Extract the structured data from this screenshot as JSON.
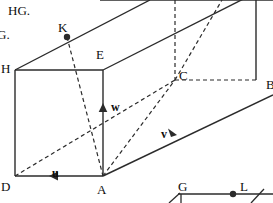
{
  "figure": {
    "title_fragments": [
      {
        "id": "note-hg",
        "text": "HG.",
        "x": 8,
        "y": 4
      },
      {
        "id": "note-g",
        "text": "G.",
        "x": -3,
        "y": 28
      }
    ],
    "stroke_color": "#2b2b2b",
    "label_color": "#0d0d0d",
    "background": "#ffffff",
    "vertex_labels": [
      {
        "name": "H",
        "text": "H",
        "x": 1,
        "y": 62
      },
      {
        "name": "K",
        "text": "K",
        "x": 58,
        "y": 21
      },
      {
        "name": "E",
        "text": "E",
        "x": 96,
        "y": 48
      },
      {
        "name": "C",
        "text": "C",
        "x": 179,
        "y": 69
      },
      {
        "name": "B",
        "text": "B",
        "x": 266,
        "y": 78
      },
      {
        "name": "D",
        "text": "D",
        "x": 1,
        "y": 180
      },
      {
        "name": "A",
        "text": "A",
        "x": 97,
        "y": 183
      }
    ],
    "vector_labels": [
      {
        "name": "u",
        "text": "u",
        "x": 52,
        "y": 167
      },
      {
        "name": "v",
        "text": "v",
        "x": 161,
        "y": 128
      },
      {
        "name": "w",
        "text": "w",
        "x": 111,
        "y": 101
      }
    ],
    "sub_figure_labels": [
      {
        "name": "G",
        "text": "G",
        "x": 178,
        "y": 180
      },
      {
        "name": "L",
        "text": "L",
        "x": 240,
        "y": 180
      }
    ],
    "marked_points": [
      {
        "name": "point-K",
        "x": 67,
        "y": 37
      },
      {
        "name": "point-L",
        "x": 233,
        "y": 194
      }
    ],
    "solid_edges": [
      {
        "name": "edge-H-E",
        "x1": 15,
        "y1": 70,
        "x2": 103,
        "y2": 70
      },
      {
        "name": "edge-H-D",
        "x1": 15,
        "y1": 70,
        "x2": 15,
        "y2": 176
      },
      {
        "name": "edge-D-A",
        "x1": 15,
        "y1": 176,
        "x2": 103,
        "y2": 176
      },
      {
        "name": "edge-A-E",
        "x1": 103,
        "y1": 176,
        "x2": 103,
        "y2": 70
      },
      {
        "name": "edge-H-top",
        "x1": 15,
        "y1": 70,
        "x2": 150,
        "y2": 0
      },
      {
        "name": "edge-E-upper",
        "x1": 103,
        "y1": 70,
        "x2": 273,
        "y2": -16
      },
      {
        "name": "edge-top-far",
        "x1": 100,
        "y1": 0,
        "x2": 273,
        "y2": 0
      },
      {
        "name": "edge-A-B",
        "x1": 103,
        "y1": 176,
        "x2": 273,
        "y2": 95
      },
      {
        "name": "edge-B-upper",
        "x1": 256,
        "y1": 80,
        "x2": 256,
        "y2": -8
      }
    ],
    "dashed_edges": [
      {
        "name": "dash-C-vertical",
        "x1": 175,
        "y1": 0,
        "x2": 175,
        "y2": 80
      },
      {
        "name": "dash-C-B",
        "x1": 175,
        "y1": 80,
        "x2": 256,
        "y2": 80
      },
      {
        "name": "dash-K-A",
        "x1": 67,
        "y1": 37,
        "x2": 103,
        "y2": 176
      },
      {
        "name": "dash-D-C",
        "x1": 15,
        "y1": 176,
        "x2": 175,
        "y2": 80
      },
      {
        "name": "dash-A-C",
        "x1": 103,
        "y1": 176,
        "x2": 175,
        "y2": 80
      },
      {
        "name": "dash-C-diag",
        "x1": 175,
        "y1": 80,
        "x2": 222,
        "y2": 0
      }
    ],
    "arrow_markers": [
      {
        "name": "arrow-u",
        "x": 55,
        "y": 176,
        "dir": "left"
      },
      {
        "name": "arrow-v",
        "x": 172,
        "y": 132,
        "dir": "down-right"
      },
      {
        "name": "arrow-w",
        "x": 103,
        "y": 110,
        "dir": "up"
      }
    ],
    "sub_figure": {
      "name": "sub-figure-GL",
      "baseline": {
        "x1": 178,
        "y1": 194,
        "x2": 273,
        "y2": 194
      },
      "left_tick": {
        "x1": 169,
        "y1": 203,
        "x2": 180,
        "y2": 193
      },
      "left_vert": {
        "x1": 181,
        "y1": 194,
        "x2": 181,
        "y2": 203
      },
      "right_tick": {
        "x1": 251,
        "y1": 203,
        "x2": 264,
        "y2": 189
      }
    }
  }
}
